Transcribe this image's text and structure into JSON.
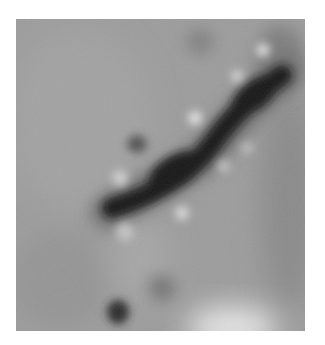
{
  "image": {
    "description": "Grayscale micrograph showing an elongated dark rod-shaped object oriented diagonally from lower-left to upper-right, surrounded by small bright and dark spots on a mid-gray background",
    "background_color": "#9a9a9a",
    "border_color": "#ffffff",
    "main_object": {
      "shape": "elongated rod",
      "color": "#151515",
      "from": [
        108,
        210
      ],
      "to": [
        285,
        70
      ]
    },
    "bright_spots": [
      {
        "x": 195,
        "y": 118
      },
      {
        "x": 237,
        "y": 75
      },
      {
        "x": 263,
        "y": 50
      },
      {
        "x": 120,
        "y": 178
      },
      {
        "x": 182,
        "y": 213
      },
      {
        "x": 224,
        "y": 165
      },
      {
        "x": 247,
        "y": 148
      },
      {
        "x": 125,
        "y": 232
      }
    ],
    "dark_spots": [
      {
        "x": 118,
        "y": 312
      },
      {
        "x": 162,
        "y": 288
      },
      {
        "x": 137,
        "y": 143
      },
      {
        "x": 200,
        "y": 40
      }
    ],
    "bright_region": {
      "x": 230,
      "y": 322
    }
  }
}
